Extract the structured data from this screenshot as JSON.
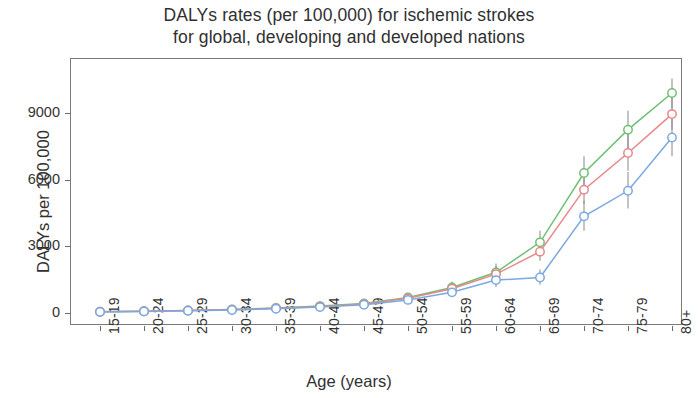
{
  "title": {
    "line1": "DALYs rates (per 100,000) for ischemic strokes",
    "line2": "for global, developing and developed nations"
  },
  "axes": {
    "ylabel": "DALYs per 100,000",
    "xlabel": "Age (years)",
    "yticks": [
      "0",
      "3000",
      "6000",
      "9000"
    ],
    "xticks": [
      "15-19",
      "20-24",
      "25-29",
      "30-34",
      "35-39",
      "40-44",
      "45-49",
      "50-54",
      "55-59",
      "60-64",
      "65-69",
      "70-74",
      "75-79",
      "80+"
    ]
  },
  "colors": {
    "global": "#e8868a",
    "developing": "#6fbf73",
    "developed": "#7aa8e0",
    "errorbar": "#8a8a8a",
    "frame": "#7a7a7a"
  },
  "chart_data": {
    "type": "line",
    "title": "DALYs rates (per 100,000) for ischemic strokes for global, developing and developed nations",
    "xlabel": "Age (years)",
    "ylabel": "DALYs per 100,000",
    "ylim": [
      0,
      10600
    ],
    "yticks": [
      0,
      3000,
      6000,
      9000
    ],
    "grid": false,
    "legend": "none",
    "categories": [
      "15-19",
      "20-24",
      "25-29",
      "30-34",
      "35-39",
      "40-44",
      "45-49",
      "50-54",
      "55-59",
      "60-64",
      "65-69",
      "70-74",
      "75-79",
      "80+"
    ],
    "series": [
      {
        "name": "developing",
        "color": "#6fbf73",
        "values": [
          55,
          80,
          115,
          160,
          225,
          310,
          430,
          700,
          1150,
          1830,
          3180,
          6300,
          8250,
          9900
        ],
        "err_low": [
          40,
          60,
          90,
          125,
          180,
          250,
          350,
          570,
          940,
          1500,
          2700,
          5550,
          7400,
          9200
        ],
        "err_high": [
          75,
          105,
          150,
          205,
          285,
          390,
          540,
          870,
          1420,
          2230,
          3700,
          7050,
          9100,
          10550
        ]
      },
      {
        "name": "global",
        "color": "#e8868a",
        "values": [
          55,
          78,
          110,
          152,
          212,
          292,
          405,
          660,
          1090,
          1750,
          2760,
          5550,
          7200,
          8950
        ],
        "err_low": [
          42,
          60,
          86,
          120,
          170,
          236,
          330,
          540,
          900,
          1450,
          2350,
          4900,
          6400,
          8250
        ],
        "err_high": [
          70,
          98,
          138,
          190,
          264,
          360,
          496,
          800,
          1320,
          2110,
          3250,
          6250,
          8050,
          9700
        ]
      },
      {
        "name": "developed",
        "color": "#7aa8e0",
        "values": [
          52,
          72,
          100,
          138,
          192,
          265,
          370,
          590,
          930,
          1480,
          1600,
          4350,
          5500,
          7900
        ],
        "err_low": [
          38,
          54,
          76,
          106,
          148,
          205,
          288,
          460,
          730,
          1170,
          1280,
          3700,
          4700,
          7050
        ],
        "err_high": [
          68,
          92,
          128,
          176,
          244,
          334,
          462,
          730,
          1150,
          1820,
          1960,
          5050,
          6350,
          8750
        ]
      }
    ]
  }
}
